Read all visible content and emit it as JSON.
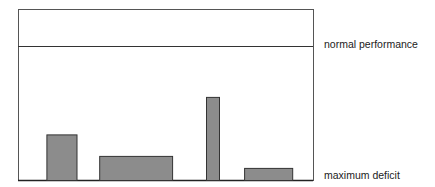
{
  "chart_data": {
    "type": "bar",
    "title": "",
    "xlabel": "",
    "ylabel": "",
    "ylim": [
      0,
      100
    ],
    "grid": false,
    "legend": "none",
    "reference_lines": [
      {
        "name": "normal performance",
        "value": 100,
        "label": "normal performance"
      },
      {
        "name": "maximum deficit",
        "value": 0,
        "label": "maximum deficit"
      }
    ],
    "bars": [
      {
        "name": "bar-1",
        "value": 34,
        "x_start": 0.098,
        "x_end": 0.2
      },
      {
        "name": "bar-2",
        "value": 18,
        "x_start": 0.277,
        "x_end": 0.524
      },
      {
        "name": "bar-3",
        "value": 62,
        "x_start": 0.639,
        "x_end": 0.683
      },
      {
        "name": "bar-4",
        "value": 9,
        "x_start": 0.768,
        "x_end": 0.931
      }
    ],
    "colors": {
      "bar_fill": "#8c8c8c",
      "bar_stroke": "#333333",
      "frame": "#444444"
    }
  }
}
